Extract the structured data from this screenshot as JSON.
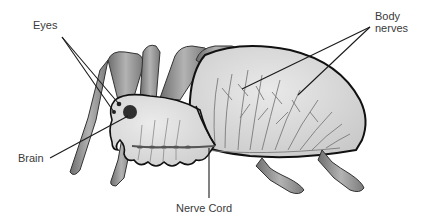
{
  "diagram": {
    "labels": {
      "eyes": "Eyes",
      "brain": "Brain",
      "nerve_cord": "Nerve Cord",
      "body_nerves_line1": "Body",
      "body_nerves_line2": "nerves"
    },
    "colors": {
      "background": "#ffffff",
      "label_text": "#3a3a3a",
      "leader_line": "#1a1a1a",
      "body_fill": "#dcdcdc",
      "body_outline": "#111111",
      "leg_fill": "#9a9a9a",
      "nerve_stroke": "#7a7a7a",
      "brain_fill": "#3a3a3a"
    }
  }
}
